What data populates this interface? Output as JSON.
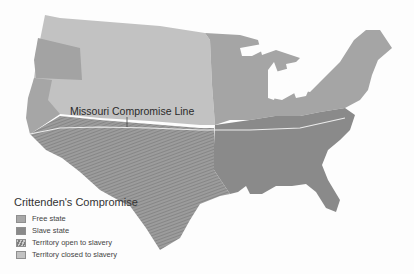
{
  "map": {
    "title": "Crittenden's Compromise",
    "annotation": "Missouri Compromise Line",
    "legend": [
      {
        "label": "Free state",
        "color": "#a8a8a8",
        "pattern": "solid"
      },
      {
        "label": "Slave state",
        "color": "#8a8a8a",
        "pattern": "solid"
      },
      {
        "label": "Territory open to slavery",
        "color": "#959595",
        "pattern": "hatched"
      },
      {
        "label": "Territory closed to slavery",
        "color": "#c2c2c2",
        "pattern": "solid"
      }
    ],
    "colors": {
      "free_state": "#a8a8a8",
      "slave_state": "#8a8a8a",
      "territory_open": "#959595",
      "territory_closed": "#c2c2c2",
      "border": "#e8e8e8"
    }
  }
}
